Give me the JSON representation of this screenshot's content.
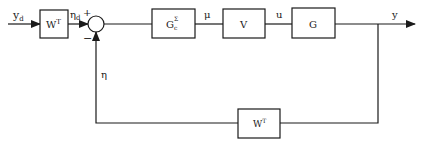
{
  "diagram": {
    "type": "block-diagram",
    "blocks": [
      {
        "id": "wt_in",
        "label": "W",
        "sup": "T"
      },
      {
        "id": "gc",
        "label": "G",
        "sub": "c",
        "sup": "Σ"
      },
      {
        "id": "v",
        "label": "V"
      },
      {
        "id": "g",
        "label": "G"
      },
      {
        "id": "wt_fb",
        "label": "W",
        "sup": "T"
      }
    ],
    "signals": {
      "yd": {
        "label": "y",
        "sub": "d"
      },
      "etad": {
        "label": "η",
        "sub": "d"
      },
      "plus": "+",
      "minus": "−",
      "eta": "η",
      "mu": "μ",
      "u": "u",
      "y": "y"
    },
    "colors": {
      "line": "#1a1a1a",
      "background": "#ffffff"
    }
  }
}
